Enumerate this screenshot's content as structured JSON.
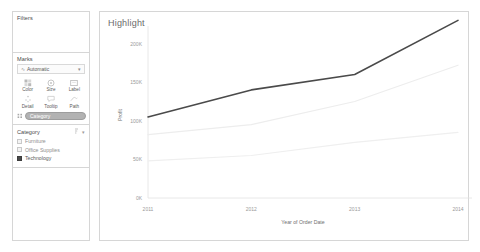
{
  "sidebar": {
    "filters": {
      "title": "Filters"
    },
    "marks": {
      "title": "Marks",
      "mark_type": "Automatic",
      "mark_type_icon": "line-mark-icon",
      "caret_icon": "chevron-down-icon",
      "buttons": [
        {
          "label": "Color",
          "icon": "color-palette-icon"
        },
        {
          "label": "Size",
          "icon": "size-circle-icon"
        },
        {
          "label": "Label",
          "icon": "label-tag-icon"
        },
        {
          "label": "Detail",
          "icon": "detail-icon"
        },
        {
          "label": "Tooltip",
          "icon": "tooltip-bubble-icon"
        },
        {
          "label": "Path",
          "icon": "path-line-icon"
        }
      ],
      "pill": {
        "label": "Category",
        "handle_icon": "drag-handle-icon"
      }
    },
    "legend": {
      "title": "Category",
      "sort_icon": "sort-icon",
      "menu_icon": "chevron-down-icon",
      "items": [
        {
          "label": "Furniture",
          "color": "#f2f2f2",
          "selected": false
        },
        {
          "label": "Office Supplies",
          "color": "#f2f2f2",
          "selected": false
        },
        {
          "label": "Technology",
          "color": "#4a4a4a",
          "selected": true
        }
      ]
    }
  },
  "panel": {
    "title": "Highlight"
  },
  "chart_data": {
    "type": "line",
    "title": "Highlight",
    "xlabel": "Year of Order Date",
    "ylabel": "Profit",
    "x": [
      "2011",
      "2012",
      "2013",
      "2014"
    ],
    "xticks": [
      "2011",
      "2012",
      "2013",
      "2014"
    ],
    "yticks": [
      "0K",
      "50K",
      "100K",
      "150K",
      "200K"
    ],
    "ytick_values": [
      0,
      50000,
      100000,
      150000,
      200000
    ],
    "ylim": [
      0,
      215000
    ],
    "grid": false,
    "legend_position": "sidebar",
    "series": [
      {
        "name": "Technology",
        "values": [
          105000,
          140000,
          160000,
          230000
        ],
        "color": "#4a4a4a",
        "highlighted": true,
        "width": 1.6
      },
      {
        "name": "Office Supplies",
        "values": [
          82000,
          95000,
          125000,
          172000
        ],
        "color": "#ededed",
        "highlighted": false,
        "width": 1.2
      },
      {
        "name": "Furniture",
        "values": [
          48000,
          55000,
          72000,
          85000
        ],
        "color": "#efefef",
        "highlighted": false,
        "width": 1.2
      }
    ]
  }
}
